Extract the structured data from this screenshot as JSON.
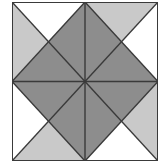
{
  "figure": {
    "type": "geometric-tiling",
    "canvas": {
      "width": 168,
      "height": 168,
      "background": "#ffffff"
    },
    "block": {
      "x": 12,
      "y": 2,
      "width": 146,
      "height": 159,
      "border_color": "#3a3a3a",
      "border_width": 2
    },
    "palette": {
      "dark_gray": "#8d8d8d",
      "light_gray": "#c9c9c9",
      "white": "#ffffff",
      "line": "#3a3a3a",
      "background": "#ffffff"
    },
    "geometry": {
      "unit_box": {
        "x0": 0,
        "y0": 0,
        "x1": 146,
        "y1": 159
      },
      "center": {
        "x": 73,
        "y": 79.5
      },
      "midpoints": {
        "top": {
          "x": 73,
          "y": 0
        },
        "right": {
          "x": 146,
          "y": 79.5
        },
        "bottom": {
          "x": 73,
          "y": 159
        },
        "left": {
          "x": 0,
          "y": 79.5
        }
      },
      "corners": {
        "top_left": {
          "x": 0,
          "y": 0
        },
        "top_right": {
          "x": 146,
          "y": 0
        },
        "bottom_right": {
          "x": 146,
          "y": 159
        },
        "bottom_left": {
          "x": 0,
          "y": 159
        }
      }
    },
    "shapes": [
      {
        "name": "center-diamond-triangle-north",
        "fill": "dark_gray",
        "points": "73,0 146,79.5 73,79.5"
      },
      {
        "name": "center-diamond-triangle-west",
        "fill": "dark_gray",
        "points": "73,0 73,79.5 0,79.5"
      },
      {
        "name": "center-diamond-triangle-south",
        "fill": "dark_gray",
        "points": "0,79.5 73,79.5 73,159"
      },
      {
        "name": "center-diamond-triangle-east",
        "fill": "dark_gray",
        "points": "73,79.5 146,79.5 73,159"
      },
      {
        "name": "corner-top-left-light-triangle",
        "fill": "light_gray",
        "points": "0,0 73,0 0,79.5"
      },
      {
        "name": "corner-top-left-white-triangle",
        "fill": "white",
        "points": "0,0 73,0 73,0"
      },
      {
        "name": "corner-top-right-light-triangle",
        "fill": "light_gray",
        "points": "73,0 146,0 146,79.5"
      },
      {
        "name": "corner-bottom-left-light-triangle",
        "fill": "light_gray",
        "points": "0,79.5 73,159 0,159"
      },
      {
        "name": "corner-bottom-right-light-triangle",
        "fill": "light_gray",
        "points": "146,79.5 146,159 73,159"
      }
    ],
    "lines": [
      {
        "name": "diagonal-top-left-to-center",
        "x1": 0,
        "y1": 0,
        "x2": 73,
        "y2": 79.5
      },
      {
        "name": "diagonal-top-right-to-center",
        "x1": 146,
        "y1": 0,
        "x2": 73,
        "y2": 79.5
      },
      {
        "name": "diagonal-bottom-left-to-center",
        "x1": 0,
        "y1": 159,
        "x2": 73,
        "y2": 79.5
      },
      {
        "name": "diagonal-bottom-right-to-center",
        "x1": 146,
        "y1": 159,
        "x2": 73,
        "y2": 79.5
      },
      {
        "name": "diamond-edge-top-left",
        "x1": 73,
        "y1": 0,
        "x2": 0,
        "y2": 79.5
      },
      {
        "name": "diamond-edge-top-right",
        "x1": 73,
        "y1": 0,
        "x2": 146,
        "y2": 79.5
      },
      {
        "name": "diamond-edge-bottom-left",
        "x1": 0,
        "y1": 79.5,
        "x2": 73,
        "y2": 159
      },
      {
        "name": "diamond-edge-bottom-right",
        "x1": 146,
        "y1": 79.5,
        "x2": 73,
        "y2": 159
      },
      {
        "name": "cross-horizontal",
        "x1": 0,
        "y1": 79.5,
        "x2": 146,
        "y2": 79.5
      },
      {
        "name": "cross-vertical",
        "x1": 73,
        "y1": 0,
        "x2": 73,
        "y2": 159
      }
    ]
  }
}
